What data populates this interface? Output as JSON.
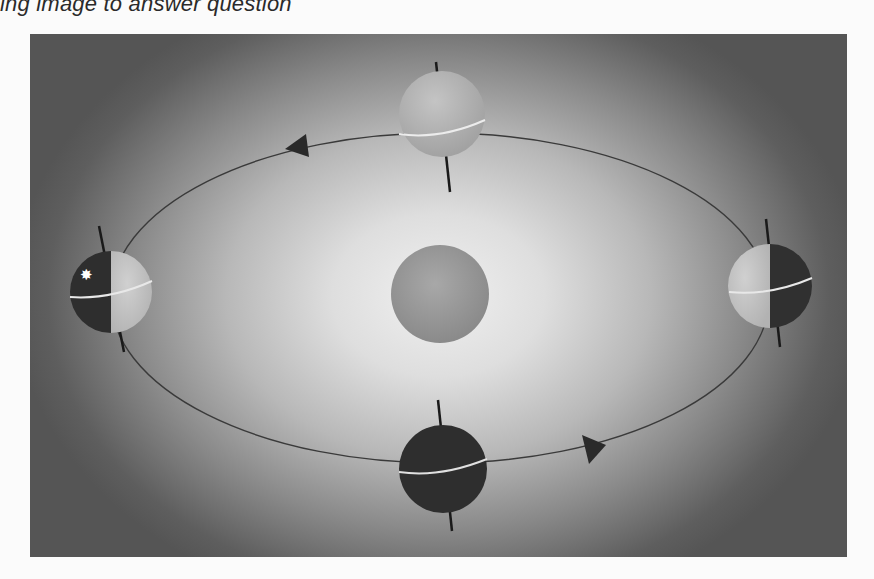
{
  "caption": {
    "top_text": "ing image to answer question",
    "bottom_text": ""
  },
  "diagram": {
    "sun": {
      "label": "sun",
      "cx": 440,
      "cy": 294,
      "r": 49,
      "color": "#9a9a9a"
    },
    "orbit": {
      "cx": 440,
      "cy": 298,
      "rx": 329,
      "ry": 165,
      "stroke": "#3a3a3a"
    },
    "direction_arrows": [
      {
        "name": "arrow-top-left",
        "x": 298,
        "y": 147,
        "direction": "left"
      },
      {
        "name": "arrow-bottom-right",
        "x": 590,
        "y": 450,
        "direction": "right"
      }
    ],
    "earths": [
      {
        "name": "earth-top",
        "position": "top",
        "cx": 442,
        "cy": 114,
        "r": 43,
        "lit": "full",
        "light": "#b0b0b0",
        "dark": "#b0b0b0"
      },
      {
        "name": "earth-left",
        "position": "left",
        "cx": 111,
        "cy": 292,
        "r": 41,
        "lit": "right-half",
        "light": "#c4c4c4",
        "dark": "#2c2c2c",
        "marker": "star"
      },
      {
        "name": "earth-right",
        "position": "right",
        "cx": 770,
        "cy": 286,
        "r": 42,
        "lit": "left-half",
        "light": "#c8c8c8",
        "dark": "#303030"
      },
      {
        "name": "earth-bottom",
        "position": "bottom",
        "cx": 443,
        "cy": 469,
        "r": 44,
        "lit": "none",
        "light": "#2e2e2e",
        "dark": "#2e2e2e"
      }
    ],
    "marker_symbol": "✸",
    "colors": {
      "axis": "#1a1a1a",
      "equator": "#e8e8e8",
      "background_edge": "#555555",
      "background_center": "#f0f0f0"
    }
  }
}
